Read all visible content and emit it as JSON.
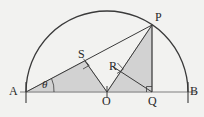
{
  "figure": {
    "background_color": "#f2f2f0",
    "stroke_color": "#3a3a3a",
    "baseline_color": "#9a9a9a",
    "shade_color": "#d2d2d2",
    "shade_edge_color": "#8d8d8d",
    "canvas": {
      "width": 204,
      "height": 117
    }
  },
  "geometry": {
    "center": {
      "x": 107,
      "y": 92
    },
    "radius": 81,
    "points": {
      "A": {
        "x": 26,
        "y": 92
      },
      "B": {
        "x": 188,
        "y": 92
      },
      "O": {
        "x": 107,
        "y": 92
      },
      "P": {
        "x": 152,
        "y": 25
      },
      "Q": {
        "x": 152,
        "y": 92
      },
      "S": {
        "x": 85,
        "y": 61
      },
      "R": {
        "x": 120,
        "y": 70
      }
    },
    "arc": {
      "start": "A",
      "end": "B",
      "sweep": "upper-semicircle"
    },
    "segments": [
      {
        "from": "A",
        "to": "B",
        "kind": "diameter-baseline"
      },
      {
        "from": "A",
        "to": "P",
        "kind": "chord"
      },
      {
        "from": "O",
        "to": "S",
        "kind": "perpendicular-to-AP"
      },
      {
        "from": "O",
        "to": "P",
        "kind": "radius"
      },
      {
        "from": "P",
        "to": "Q",
        "kind": "perpendicular-to-AB"
      },
      {
        "from": "O",
        "to": "Q",
        "kind": "baseline-part"
      },
      {
        "from": "Q",
        "to": "R",
        "kind": "perpendicular-to-OP"
      },
      {
        "from": "Q",
        "to": "P",
        "kind": "leg"
      }
    ],
    "right_angles": [
      {
        "at": "S",
        "between": [
          "A",
          "P"
        ],
        "vertex_from": "O"
      },
      {
        "at": "R",
        "between": [
          "O",
          "P"
        ],
        "vertex_from": "Q"
      },
      {
        "at": "Q",
        "between": [
          "O",
          "B"
        ],
        "vertex_from": "P"
      }
    ],
    "shaded_regions": [
      {
        "name": "triangle-A-S-O",
        "vertices": [
          "A",
          "S",
          "O"
        ]
      },
      {
        "name": "triangle-O-P-Q",
        "vertices": [
          "O",
          "P",
          "Q"
        ]
      }
    ],
    "tick_marks": [
      {
        "at": "A",
        "orientation": "vertical"
      },
      {
        "at": "O",
        "orientation": "vertical"
      },
      {
        "at": "B",
        "orientation": "vertical"
      }
    ]
  },
  "labels": {
    "A": {
      "text": "A",
      "x": 9,
      "y": 85
    },
    "B": {
      "text": "B",
      "x": 190,
      "y": 85
    },
    "O": {
      "text": "O",
      "x": 102,
      "y": 95
    },
    "P": {
      "text": "P",
      "x": 155,
      "y": 11
    },
    "Q": {
      "text": "Q",
      "x": 148,
      "y": 95
    },
    "R": {
      "text": "R",
      "x": 109,
      "y": 60
    },
    "S": {
      "text": "S",
      "x": 78,
      "y": 48
    },
    "theta": {
      "text": "θ",
      "x": 42,
      "y": 79
    }
  }
}
